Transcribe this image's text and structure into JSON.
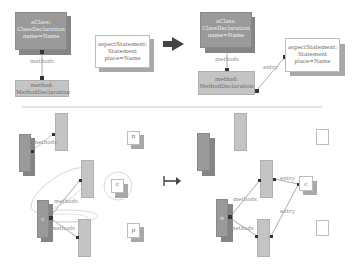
{
  "top_left": {
    "class_box": {
      "lines": [
        "aClass:",
        "ClassDeclaration",
        "name=Name"
      ]
    },
    "edge_methods": "methods",
    "method_box": {
      "lines": [
        "method:",
        "MethodDeclaration"
      ]
    },
    "aspect_box": {
      "lines": [
        "aspectStatement:",
        "Statement",
        "place=Name"
      ]
    }
  },
  "top_right": {
    "class_box": {
      "lines": [
        "aClass:",
        "ClassDeclaration",
        "name=Name"
      ]
    },
    "edge_methods": "methods",
    "edge_entry": "entry",
    "method_box": {
      "lines": [
        "method:",
        "MethodDeclaration"
      ]
    },
    "aspect_box": {
      "lines": [
        "aspectStatement:",
        "Statement",
        "place=Name"
      ]
    }
  },
  "bottom_left": {
    "edge_methods_1": "methods",
    "edge_methods_2": "methods",
    "edge_methods_3": "methods",
    "node_n": "n",
    "node_c": "c",
    "node_p": "p",
    "node_c_small": "c"
  },
  "bottom_right": {
    "edge_methods_1": "methods",
    "edge_methods_2": "methods",
    "edge_entry_1": "entry",
    "edge_entry_2": "entry",
    "node_c": "c",
    "node_n": "n"
  },
  "colors": {
    "dark_node": "#9a9a9a",
    "light_node": "#c4c4c4",
    "shadow": "#a8a8a8",
    "arrow": "#444444",
    "edge": "#888888"
  }
}
